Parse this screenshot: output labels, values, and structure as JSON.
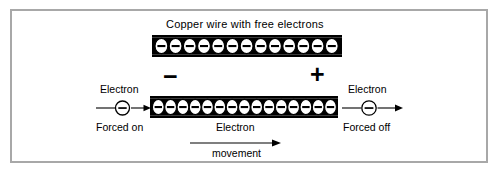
{
  "figure": {
    "title": "Copper wire with free electrons",
    "background_color": "#ffffff",
    "frame_color": "#a8a8a8",
    "ink_color": "#000000"
  },
  "labels": {
    "title": "Copper wire with free electrons",
    "sign_negative": "−",
    "sign_positive": "+",
    "left_electron": "Electron",
    "left_forced": "Forced on",
    "right_electron": "Electron",
    "right_forced": "Forced off",
    "movement_top": "Electron",
    "movement_bottom": "movement"
  },
  "diagram": {
    "type": "physics-schematic",
    "wires": [
      {
        "name": "top-wire",
        "label": "Copper wire with free electrons",
        "electron_count": 13,
        "charge_symbol": "−",
        "description": "copper wire shown with free electrons at rest"
      },
      {
        "name": "bottom-wire",
        "label": "",
        "electron_count": 15,
        "charge_symbol": "−",
        "description": "copper wire with electrons drifting from negative to positive terminal"
      }
    ],
    "terminals": [
      {
        "name": "negative-terminal",
        "symbol": "−",
        "side": "left"
      },
      {
        "name": "positive-terminal",
        "symbol": "+",
        "side": "right"
      }
    ],
    "free_electrons": [
      {
        "name": "incoming-electron",
        "symbol": "−",
        "caption_top": "Electron",
        "caption_bottom": "Forced on",
        "direction": "right"
      },
      {
        "name": "outgoing-electron",
        "symbol": "−",
        "caption_top": "Electron",
        "caption_bottom": "Forced off",
        "direction": "right"
      }
    ],
    "flow_arrow": {
      "name": "electron-movement-arrow",
      "caption_top": "Electron",
      "caption_bottom": "movement",
      "direction": "right"
    }
  }
}
